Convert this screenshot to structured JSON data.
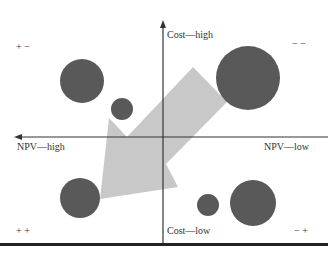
{
  "diagram": {
    "type": "portfolio-bubble-matrix",
    "axes": {
      "y_top": "Cost—high",
      "y_bottom": "Cost—low",
      "x_left": "NPV—high",
      "x_right": "NPV—low"
    },
    "quadrants": {
      "top_left": "+ −",
      "top_right": "− −",
      "bottom_left": "+ +",
      "bottom_right": "− +"
    },
    "bubbles": [
      {
        "cx": 82,
        "cy": 81,
        "r": 22
      },
      {
        "cx": 122,
        "cy": 109,
        "r": 11
      },
      {
        "cx": 248,
        "cy": 78,
        "r": 32
      },
      {
        "cx": 80,
        "cy": 198,
        "r": 20
      },
      {
        "cx": 208,
        "cy": 205,
        "r": 11
      },
      {
        "cx": 253,
        "cy": 203,
        "r": 23
      }
    ],
    "arrow": {
      "direction": "toward lower-left (++)",
      "color": "#c8c8c8"
    },
    "colors": {
      "bubble": "#595959",
      "axis": "#333333",
      "arrow": "#c8c8c8"
    }
  }
}
